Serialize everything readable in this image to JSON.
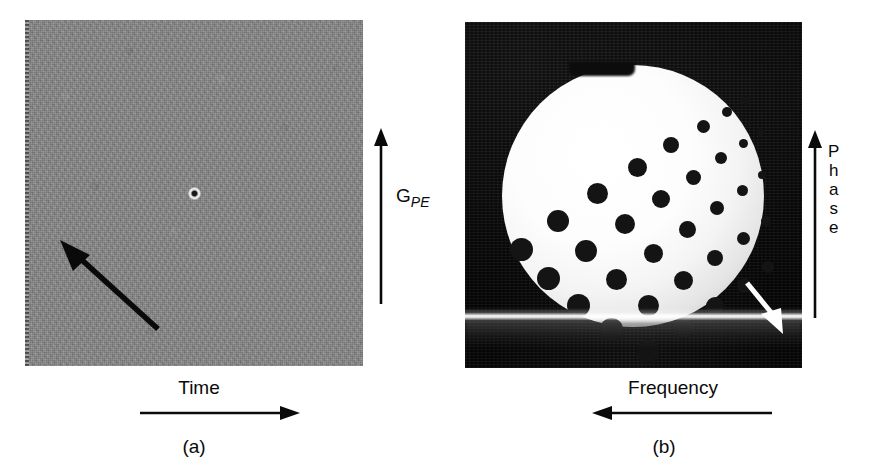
{
  "figure": {
    "type": "scientific-figure",
    "background_color": "#ffffff"
  },
  "panel_a": {
    "caption": "(a)",
    "image_name": "k-space-raw-data",
    "fill_color": "#878787",
    "center_feature": "bright DC point at centre of k-space",
    "horizontal_axis": {
      "label": "Time",
      "arrow_direction": "right"
    },
    "vertical_axis": {
      "label_main": "G",
      "label_subscript": "PE",
      "arrow_direction": "up"
    },
    "annotation_arrow": {
      "name": "kspace-direction-arrow",
      "color": "#0a0a0a",
      "direction": "up-left"
    }
  },
  "panel_b": {
    "caption": "(b)",
    "image_name": "reconstructed-phantom-image",
    "background_color": "#070707",
    "phantom_color": "#ffffff",
    "phantom_shape": "circular phantom with flattened notch at top",
    "dot_array_description": "fan-shaped array of dark resolution dots, increasing in size toward lower-left",
    "artifact": "bright horizontal FID band across lower image",
    "horizontal_axis": {
      "label": "Frequency",
      "arrow_direction": "left"
    },
    "vertical_axis": {
      "label": "Phase",
      "letters": [
        "P",
        "h",
        "a",
        "s",
        "e"
      ],
      "arrow_direction": "up"
    },
    "annotation_arrow": {
      "name": "artifact-pointer-arrow",
      "color": "#ffffff",
      "direction": "down-right",
      "points_at": "bright horizontal artifact band"
    }
  },
  "chart_data": {
    "type": "scatter",
    "title": "",
    "xlabel": "Frequency",
    "ylabel": "Phase",
    "legend": [],
    "grid": false,
    "dots": [
      {
        "x": 56,
        "y": 227,
        "d": 23
      },
      {
        "x": 93,
        "y": 199,
        "d": 22
      },
      {
        "x": 132,
        "y": 171,
        "d": 21
      },
      {
        "x": 172,
        "y": 145,
        "d": 19
      },
      {
        "x": 206,
        "y": 123,
        "d": 16
      },
      {
        "x": 238,
        "y": 104,
        "d": 13
      },
      {
        "x": 262,
        "y": 90,
        "d": 10
      },
      {
        "x": 281,
        "y": 79,
        "d": 8
      },
      {
        "x": 83,
        "y": 256,
        "d": 23
      },
      {
        "x": 121,
        "y": 229,
        "d": 22
      },
      {
        "x": 160,
        "y": 202,
        "d": 20
      },
      {
        "x": 196,
        "y": 177,
        "d": 18
      },
      {
        "x": 228,
        "y": 155,
        "d": 15
      },
      {
        "x": 256,
        "y": 136,
        "d": 12
      },
      {
        "x": 278,
        "y": 121,
        "d": 9
      },
      {
        "x": 295,
        "y": 110,
        "d": 7
      },
      {
        "x": 113,
        "y": 283,
        "d": 23
      },
      {
        "x": 151,
        "y": 257,
        "d": 21
      },
      {
        "x": 188,
        "y": 231,
        "d": 19
      },
      {
        "x": 222,
        "y": 207,
        "d": 17
      },
      {
        "x": 252,
        "y": 186,
        "d": 14
      },
      {
        "x": 277,
        "y": 168,
        "d": 11
      },
      {
        "x": 297,
        "y": 153,
        "d": 8
      },
      {
        "x": 146,
        "y": 307,
        "d": 23
      },
      {
        "x": 183,
        "y": 283,
        "d": 21
      },
      {
        "x": 218,
        "y": 258,
        "d": 19
      },
      {
        "x": 250,
        "y": 236,
        "d": 16
      },
      {
        "x": 278,
        "y": 216,
        "d": 13
      },
      {
        "x": 301,
        "y": 199,
        "d": 10
      },
      {
        "x": 183,
        "y": 329,
        "d": 22
      },
      {
        "x": 218,
        "y": 306,
        "d": 20
      },
      {
        "x": 250,
        "y": 284,
        "d": 18
      },
      {
        "x": 279,
        "y": 263,
        "d": 15
      },
      {
        "x": 303,
        "y": 245,
        "d": 12
      }
    ]
  }
}
